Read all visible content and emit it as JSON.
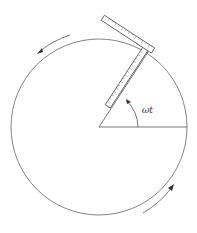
{
  "diagram": {
    "angle_label": "ωt",
    "elements": [
      "circle",
      "radius-line",
      "rotating-radius",
      "ruler-radial",
      "ruler-tangent",
      "angle-arc",
      "rotation-arrow-top",
      "rotation-arrow-bottom"
    ],
    "colors": {
      "stroke": "#555555",
      "background": "#ffffff"
    }
  }
}
